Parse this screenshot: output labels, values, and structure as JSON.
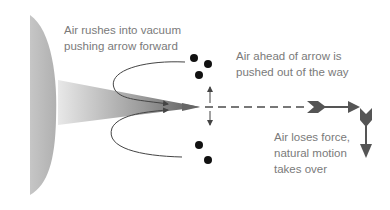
{
  "diagram": {
    "labels": {
      "rush": "Air rushes into vacuum\npushing arrow forward",
      "ahead": "Air ahead of arrow is\npushed out of the way",
      "loses": "Air loses force,\nnatural motion\ntakes over"
    },
    "colors": {
      "text": "#7a7a7a",
      "arrow": "#555555",
      "dots": "#111111",
      "bow": "#bdbdbd"
    }
  }
}
